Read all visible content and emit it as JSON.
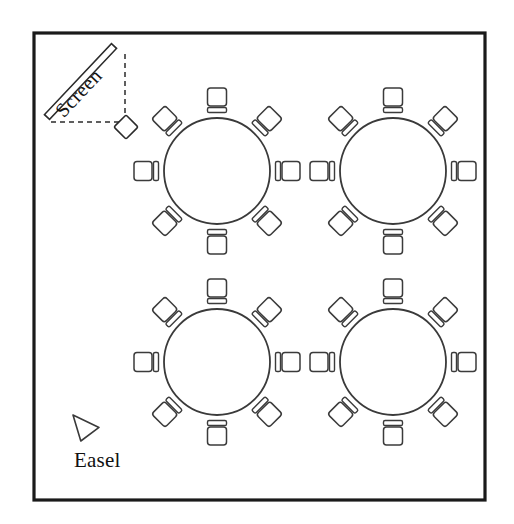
{
  "diagram": {
    "type": "floor-plan",
    "room": {
      "x": 34,
      "y": 33,
      "width": 451,
      "height": 467,
      "border_color": "#1a1a1a",
      "fill_color": "#ffffff"
    },
    "labels": {
      "screen": "Screen",
      "easel": "Easel"
    },
    "screen": {
      "name": "projection-screen",
      "from_x": 47,
      "from_y": 117,
      "to_x": 114,
      "to_y": 46,
      "thickness": 7,
      "rotation_deg": -46
    },
    "projection": {
      "name": "projection-cone",
      "apex_x": 125,
      "apex_y": 122,
      "corner_x": 51,
      "corner_y": 122,
      "top_x": 125,
      "top_y": 50,
      "style": "dashed"
    },
    "projector": {
      "name": "projector",
      "cx": 126,
      "cy": 127,
      "size": 17,
      "rotation_deg": 45
    },
    "easel": {
      "name": "easel-marker",
      "cx": 86,
      "cy": 428,
      "width": 26,
      "height": 26,
      "label_x": 74,
      "label_y": 467
    },
    "chair_geometry": {
      "seat_width": 19,
      "seat_height": 18,
      "seat_radius": 3,
      "back_width": 19,
      "back_height": 5,
      "back_gap": 1.5,
      "orbit_radius": 74
    },
    "tables": [
      {
        "name": "table-top-left",
        "id": "T1",
        "cx": 217,
        "cy": 171,
        "radius": 53,
        "seats": 8,
        "seat_angles": [
          270,
          315,
          0,
          45,
          90,
          135,
          180,
          225
        ]
      },
      {
        "name": "table-top-right",
        "id": "T2",
        "cx": 393,
        "cy": 171,
        "radius": 53,
        "seats": 8,
        "seat_angles": [
          270,
          315,
          0,
          45,
          90,
          135,
          180,
          225
        ]
      },
      {
        "name": "table-bottom-left",
        "id": "T3",
        "cx": 217,
        "cy": 362,
        "radius": 53,
        "seats": 8,
        "seat_angles": [
          270,
          315,
          0,
          45,
          90,
          135,
          180,
          225
        ]
      },
      {
        "name": "table-bottom-right",
        "id": "T4",
        "cx": 393,
        "cy": 362,
        "radius": 53,
        "seats": 8,
        "seat_angles": [
          270,
          315,
          0,
          45,
          90,
          135,
          180,
          225
        ]
      }
    ],
    "totals": {
      "tables": 4,
      "chairs_per_table": 8,
      "total_chairs": 32
    }
  }
}
